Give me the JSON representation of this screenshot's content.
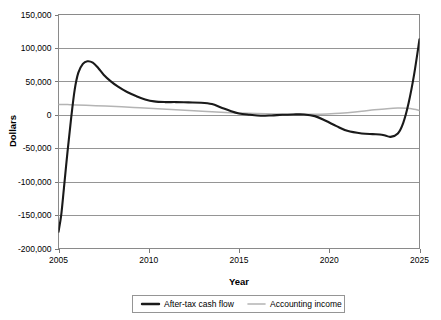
{
  "chart_data": {
    "type": "line",
    "title": "",
    "xlabel": "Year",
    "ylabel": "Dollars",
    "xlim": [
      2005,
      2025
    ],
    "ylim": [
      -200000,
      150000
    ],
    "grid": true,
    "legend_position": "bottom",
    "xticks": [
      2005,
      2010,
      2015,
      2020,
      2025
    ],
    "xtick_labels": [
      "2005",
      "2010",
      "2015",
      "2020",
      "2025"
    ],
    "yticks": [
      150000,
      100000,
      50000,
      0,
      -50000,
      -100000,
      -150000,
      -200000
    ],
    "ytick_labels": [
      "150,000",
      "100,000",
      "50,000",
      "0",
      "-50,000",
      "-100,000",
      "-150,000",
      "-200,000"
    ],
    "series": [
      {
        "name": "After-tax cash flow",
        "color": "#1a1a1a",
        "width": 2.1,
        "x": [
          2005.0,
          2005.15,
          2005.3,
          2005.5,
          2005.7,
          2005.9,
          2006.1,
          2006.35,
          2006.6,
          2006.9,
          2007.2,
          2007.5,
          2007.9,
          2008.3,
          2008.8,
          2009.3,
          2009.8,
          2010.3,
          2010.9,
          2011.5,
          2012.2,
          2012.9,
          2013.5,
          2014.0,
          2014.5,
          2015.0,
          2015.6,
          2016.2,
          2016.8,
          2017.4,
          2018.0,
          2018.6,
          2019.2,
          2019.8,
          2020.4,
          2021.0,
          2021.8,
          2022.4,
          2022.8,
          2023.1,
          2023.4,
          2023.8,
          2024.1,
          2024.4,
          2024.7,
          2025.0
        ],
        "y": [
          -175000,
          -150000,
          -110000,
          -55000,
          -5000,
          38000,
          63000,
          76000,
          80000,
          78000,
          70000,
          60000,
          50000,
          42000,
          34000,
          28000,
          23000,
          20000,
          19000,
          19000,
          18500,
          18000,
          16000,
          11000,
          6000,
          2000,
          0,
          -1500,
          -1000,
          0,
          500,
          500,
          -2000,
          -9000,
          -17000,
          -24000,
          -28000,
          -29000,
          -29500,
          -31000,
          -33000,
          -28000,
          -12000,
          18000,
          60000,
          113000
        ]
      },
      {
        "name": "Accounting income",
        "color": "#b4b4b4",
        "width": 1.5,
        "x": [
          2005.0,
          2005.5,
          2006.0,
          2006.8,
          2007.6,
          2008.5,
          2009.5,
          2010.5,
          2011.5,
          2012.5,
          2013.5,
          2014.5,
          2015.5,
          2016.5,
          2017.5,
          2018.5,
          2019.5,
          2020.3,
          2021.0,
          2021.8,
          2022.5,
          2023.2,
          2023.8,
          2024.3,
          2024.7,
          2025.0
        ],
        "y": [
          15500,
          15200,
          14800,
          14000,
          13000,
          12000,
          10500,
          9000,
          7500,
          6000,
          4500,
          3200,
          2200,
          1400,
          900,
          700,
          900,
          1800,
          3200,
          5200,
          7400,
          9200,
          10000,
          9600,
          8200,
          6500
        ]
      }
    ]
  },
  "legend": {
    "entries": [
      {
        "label": "After-tax cash flow"
      },
      {
        "label": "Accounting income"
      }
    ]
  }
}
